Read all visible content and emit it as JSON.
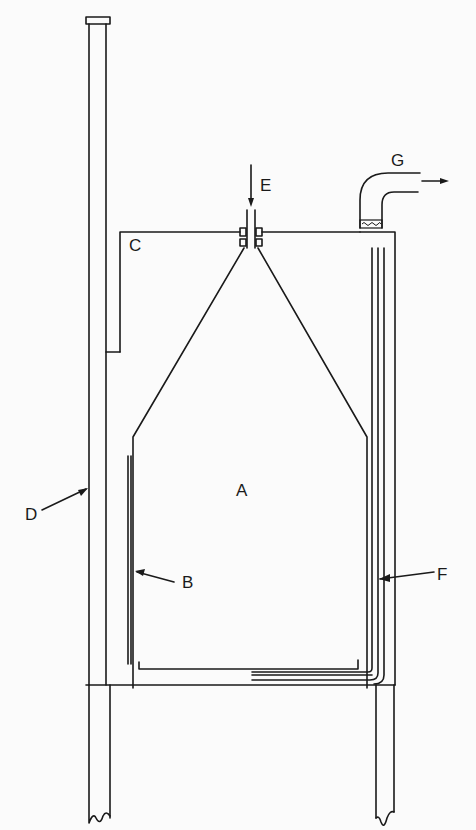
{
  "diagram": {
    "type": "apparatus cross-section",
    "labels": {
      "A": "A",
      "B": "B",
      "C": "C",
      "D": "D",
      "E": "E",
      "F": "F",
      "G": "G"
    },
    "components": [
      {
        "id": "A",
        "description": "main chamber interior"
      },
      {
        "id": "B",
        "description": "inner liner wall (left)"
      },
      {
        "id": "C",
        "description": "top cover / shoulder at upper left"
      },
      {
        "id": "D",
        "description": "tall vertical standpipe on left"
      },
      {
        "id": "E",
        "description": "inlet tube at top center with flow arrow"
      },
      {
        "id": "F",
        "description": "outlet tube running up right wall and along bottom"
      },
      {
        "id": "G",
        "description": "bent exit pipe with packing and outflow arrow"
      }
    ],
    "colors": {
      "line": "#1a1a1a",
      "background": "#fbfbfb"
    }
  }
}
